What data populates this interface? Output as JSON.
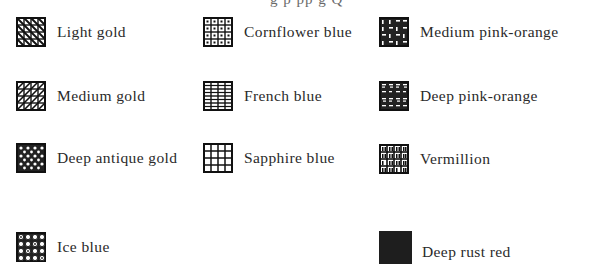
{
  "header_fragment": "g      p      pp     g    Q",
  "legend": {
    "columns": [
      {
        "items": [
          {
            "label": "Light gold",
            "pattern": "diagonal-hatch-light",
            "icon": "light-gold-swatch-icon"
          },
          {
            "label": "Medium gold",
            "pattern": "diagonal-hatch-medium",
            "icon": "medium-gold-swatch-icon"
          },
          {
            "label": "Deep antique gold",
            "pattern": "crosshatch-dense",
            "icon": "deep-antique-gold-swatch-icon"
          },
          {
            "label": "Ice blue",
            "pattern": "circles-grid",
            "icon": "ice-blue-swatch-icon"
          }
        ]
      },
      {
        "items": [
          {
            "label": "Cornflower blue",
            "pattern": "dotted-grid",
            "icon": "cornflower-blue-swatch-icon"
          },
          {
            "label": "French blue",
            "pattern": "dash-grid",
            "icon": "french-blue-swatch-icon"
          },
          {
            "label": "Sapphire blue",
            "pattern": "open-grid",
            "icon": "sapphire-blue-swatch-icon"
          }
        ]
      },
      {
        "items": [
          {
            "label": "Medium pink-orange",
            "pattern": "hook-grid-dark",
            "icon": "medium-pink-orange-swatch-icon"
          },
          {
            "label": "Deep pink-orange",
            "pattern": "bar-grid-dark",
            "icon": "deep-pink-orange-swatch-icon"
          },
          {
            "label": "Vermillion",
            "pattern": "arch-grid",
            "icon": "vermillion-swatch-icon"
          },
          {
            "label": "Deep rust red",
            "pattern": "solid",
            "icon": "deep-rust-red-swatch-icon"
          }
        ]
      }
    ]
  },
  "colors": {
    "ink": "#1a1a1a",
    "text": "#2a2a2a",
    "background": "#ffffff"
  }
}
